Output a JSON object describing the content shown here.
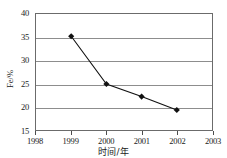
{
  "chart_data": {
    "type": "line",
    "title": "",
    "xlabel": "时间/年",
    "ylabel": "Fe/%",
    "x": [
      1999,
      2000,
      2001,
      2002
    ],
    "values": [
      35.2,
      24.9,
      22.2,
      19.3
    ],
    "series": [
      {
        "name": "Fe",
        "x": [
          1999,
          2000,
          2001,
          2002
        ],
        "values": [
          35.2,
          24.9,
          22.2,
          19.3
        ]
      }
    ],
    "xlim": [
      1998,
      2003
    ],
    "ylim": [
      15,
      40
    ],
    "xticks": [
      1998,
      1999,
      2000,
      2001,
      2002,
      2003
    ],
    "xtick_labels": [
      "1998",
      "1999",
      "2000",
      "2001",
      "2002",
      "2003"
    ],
    "yticks": [
      15,
      20,
      25,
      30,
      35,
      40
    ],
    "ytick_labels": [
      "15",
      "20",
      "25",
      "30",
      "35",
      "40"
    ],
    "grid": "horizontal",
    "legend": "none",
    "marker": "diamond",
    "line_color": "#111111",
    "marker_color": "#111111",
    "grid_color": "#8d8d8d",
    "axis_color": "#6b6b6b",
    "background": "#ffffff"
  }
}
